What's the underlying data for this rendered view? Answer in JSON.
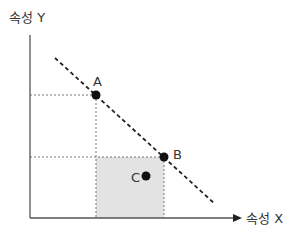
{
  "diagram": {
    "axes": {
      "y_label": "속성 Y",
      "x_label": "속성 X"
    },
    "points": [
      {
        "id": "A",
        "label": "A",
        "x": 96,
        "y": 95,
        "on_line": true
      },
      {
        "id": "B",
        "label": "B",
        "x": 164,
        "y": 157,
        "on_line": true
      },
      {
        "id": "C",
        "label": "C",
        "x": 146,
        "y": 176,
        "on_line": false
      }
    ],
    "dashed_line": {
      "x1": 55,
      "y1": 58,
      "x2": 215,
      "y2": 204
    },
    "shaded_region": {
      "x": 96,
      "y": 157,
      "width": 68,
      "height": 61,
      "fill": "#e3e3e3"
    },
    "colors": {
      "axis": "#555555",
      "point": "#111111",
      "guide": "#777777",
      "text": "#333333"
    }
  }
}
